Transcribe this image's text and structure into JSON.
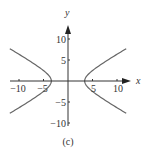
{
  "chart_data": {
    "type": "line",
    "title": "",
    "caption": "(c)",
    "xlabel": "x",
    "ylabel": "y",
    "xlim": [
      -12,
      12.5
    ],
    "ylim": [
      -10.5,
      12
    ],
    "x_ticks": [
      -10,
      -5,
      5,
      10
    ],
    "x_tick_labels": [
      "-10",
      "-5",
      "5",
      "10"
    ],
    "y_ticks": [
      10,
      5,
      -5,
      -10
    ],
    "y_tick_labels": [
      "10",
      "5",
      "-5",
      "-10"
    ],
    "grid": false,
    "legend": null,
    "curve": {
      "description": "hyperbola opening left/right, x^2/a^2 - y^2/b^2 = 1",
      "a": 3.4,
      "b": 2.3,
      "y_range": [
        -7.7,
        7.7
      ]
    },
    "series": [
      {
        "name": "right branch",
        "points": [
          [
            11.9,
            7.7
          ],
          [
            9.5,
            6
          ],
          [
            6.8,
            4
          ],
          [
            4.5,
            2
          ],
          [
            3.7,
            1
          ],
          [
            3.4,
            0
          ],
          [
            3.7,
            -1
          ],
          [
            4.5,
            -2
          ],
          [
            6.8,
            -4
          ],
          [
            9.5,
            -6
          ],
          [
            11.9,
            -7.7
          ]
        ]
      },
      {
        "name": "left branch",
        "points": [
          [
            -11.9,
            7.7
          ],
          [
            -9.5,
            6
          ],
          [
            -6.8,
            4
          ],
          [
            -4.5,
            2
          ],
          [
            -3.7,
            1
          ],
          [
            -3.4,
            0
          ],
          [
            -3.7,
            -1
          ],
          [
            -4.5,
            -2
          ],
          [
            -6.8,
            -4
          ],
          [
            -9.5,
            -6
          ],
          [
            -11.9,
            -7.7
          ]
        ]
      }
    ],
    "colors": {
      "axis": "#333333",
      "curve": "#666666",
      "text": "#333333"
    }
  }
}
